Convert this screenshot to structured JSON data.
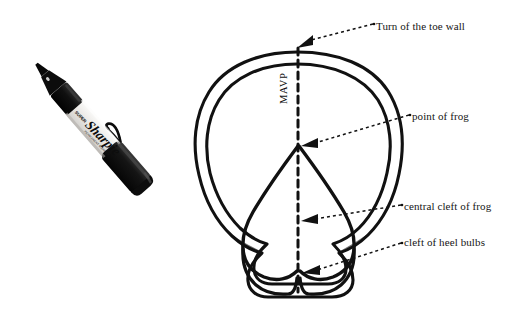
{
  "figure": {
    "background_color": "#ffffff",
    "ink_color": "#111111",
    "labels": {
      "toe_wall": "Turn of the toe wall",
      "point_of_frog": "point of frog",
      "central_cleft_of_frog": "central cleft of frog",
      "cleft_of_heel_bulbs": "cleft of heel bulbs",
      "mavp_axis": "MAVP"
    },
    "icons": {
      "marker": "sharpie-marker",
      "leader_arrow": "arrow-left-icon"
    },
    "scale_object": {
      "name": "Sharpie permanent marker",
      "brand_text": "Sharpie",
      "sub_text": "SUPER",
      "barrel_color": "#e8e8e6",
      "cap_color": "#141414"
    },
    "annotations": [
      {
        "id": "toe-wall",
        "label": "Turn of the toe wall",
        "target_x": 297,
        "target_y": 52,
        "label_x": 376,
        "label_y": 26
      },
      {
        "id": "point-frog",
        "label": "point of frog",
        "target_x": 299,
        "target_y": 146,
        "label_x": 412,
        "label_y": 116
      },
      {
        "id": "central-cleft",
        "label": "central cleft of frog",
        "target_x": 299,
        "target_y": 222,
        "label_x": 404,
        "label_y": 206
      },
      {
        "id": "heel-bulbs",
        "label": "cleft of heel bulbs",
        "target_x": 301,
        "target_y": 272,
        "label_x": 404,
        "label_y": 242
      }
    ]
  }
}
